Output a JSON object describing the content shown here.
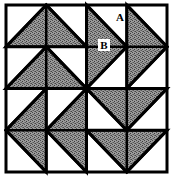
{
  "figure": {
    "name": "pinwheel-quilt-block",
    "background_color": "#ffffff",
    "line_color": "#000000",
    "fill_color": "#8c8c8c",
    "border_width": 3,
    "grid_line_width": 2.5,
    "frame": {
      "x": 6,
      "y": 5,
      "width": 161,
      "height": 167
    },
    "grid": {
      "columns": 4,
      "rows": 4,
      "cell_width": 40.25,
      "cell_height": 41.75
    }
  },
  "labels": [
    {
      "id": "label-a",
      "text": "A",
      "x": 120,
      "y": 21,
      "boxed": false
    },
    {
      "id": "label-b",
      "text": "B",
      "x": 104,
      "y": 48,
      "boxed": true
    }
  ],
  "shapes": {
    "top_left_quadrant": {
      "name": "two-up-pointing-triangles",
      "triangles": [
        {
          "id": "tl-upper",
          "points": "6,46.75 46.25,5 86.5,46.75"
        },
        {
          "id": "tl-lower",
          "points": "6,88.5 46.25,46.75 86.5,88.5"
        }
      ]
    },
    "top_right_quadrant": {
      "name": "two-right-pointing-triangles",
      "triangles": [
        {
          "id": "tr-left",
          "points": "86.5,5 86.5,88.5 126.75,46.75"
        },
        {
          "id": "tr-right",
          "points": "126.75,5 126.75,88.5 167,46.75"
        }
      ]
    },
    "bottom_left_quadrant": {
      "name": "two-left-pointing-triangles",
      "triangles": [
        {
          "id": "bl-left",
          "points": "46.25,88.5 46.25,172 6,130.25"
        },
        {
          "id": "bl-right",
          "points": "86.5,88.5 86.5,172 46.25,130.25"
        }
      ]
    },
    "bottom_right_quadrant": {
      "name": "two-down-pointing-triangles",
      "triangles": [
        {
          "id": "br-upper",
          "points": "86.5,88.5 167,88.5 126.75,130.25"
        },
        {
          "id": "br-lower",
          "points": "86.5,130.25 167,130.25 126.75,172"
        }
      ]
    }
  },
  "grid_lines": {
    "vertical": [
      46.25,
      86.5,
      126.75
    ],
    "horizontal": [
      46.75,
      88.5,
      130.25
    ]
  }
}
